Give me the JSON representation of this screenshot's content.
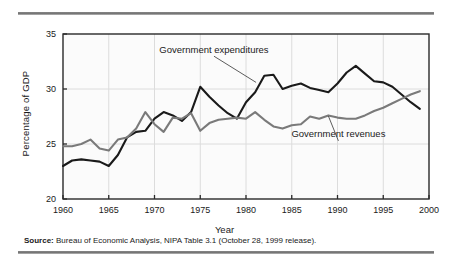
{
  "figure": {
    "source_label": "Source:",
    "source_text": "Bureau of Economic Analysis, NIPA Table 3.1 (October 28, 1999 release)."
  },
  "chart_data": {
    "type": "line",
    "title": "",
    "xlabel": "Year",
    "ylabel": "Percentage of GDP",
    "xlim": [
      1960,
      2000
    ],
    "ylim": [
      20,
      35
    ],
    "xticks": [
      1960,
      1965,
      1970,
      1975,
      1980,
      1985,
      1990,
      1995,
      2000
    ],
    "yticks": [
      20,
      25,
      30,
      35
    ],
    "grid": "vertical-and-horizontal-light",
    "legend_position": "inline-annotations",
    "x": [
      1960,
      1961,
      1962,
      1963,
      1964,
      1965,
      1966,
      1967,
      1968,
      1969,
      1970,
      1971,
      1972,
      1973,
      1974,
      1975,
      1976,
      1977,
      1978,
      1979,
      1980,
      1981,
      1982,
      1983,
      1984,
      1985,
      1986,
      1987,
      1988,
      1989,
      1990,
      1991,
      1992,
      1993,
      1994,
      1995,
      1996,
      1997,
      1998,
      1999
    ],
    "series": [
      {
        "name": "Government expenditures",
        "color": "#1a1a1a",
        "values": [
          23.0,
          23.5,
          23.6,
          23.5,
          23.4,
          23.0,
          24.0,
          25.6,
          26.1,
          26.2,
          27.3,
          27.9,
          27.6,
          27.1,
          27.9,
          30.2,
          29.3,
          28.5,
          27.8,
          27.3,
          28.8,
          29.7,
          31.2,
          31.3,
          30.0,
          30.3,
          30.5,
          30.1,
          29.9,
          29.7,
          30.5,
          31.5,
          32.1,
          31.4,
          30.7,
          30.6,
          30.2,
          29.5,
          28.8,
          28.2
        ]
      },
      {
        "name": "Government revenues",
        "color": "#7a7a7a",
        "values": [
          24.8,
          24.8,
          25.0,
          25.4,
          24.6,
          24.4,
          25.4,
          25.6,
          26.4,
          27.9,
          26.8,
          26.1,
          27.4,
          27.3,
          27.8,
          26.2,
          26.9,
          27.2,
          27.3,
          27.4,
          27.3,
          27.9,
          27.2,
          26.6,
          26.4,
          26.7,
          26.8,
          27.5,
          27.3,
          27.6,
          27.4,
          27.3,
          27.3,
          27.6,
          28.0,
          28.3,
          28.7,
          29.1,
          29.5,
          29.8
        ]
      }
    ],
    "annotations": [
      {
        "text": "Government expenditures",
        "x": 1976.5,
        "y": 33.3,
        "leader_to": {
          "x": 1981.1,
          "y": 30.6
        }
      },
      {
        "text": "Government revenues",
        "x": 1990.1,
        "y": 25.6,
        "leader_to": {
          "x": 1989.0,
          "y": 27.55
        }
      }
    ]
  }
}
